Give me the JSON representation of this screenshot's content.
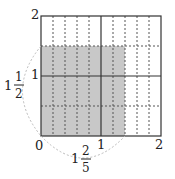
{
  "diagram": {
    "type": "area-model-multiplication",
    "grid": {
      "x_max": 2,
      "y_max": 2,
      "x_subdivisions_per_unit": 5,
      "y_subdivisions_per_unit": 2
    },
    "shaded_region": {
      "width": "1 2/5",
      "height": "1 1/2",
      "fill": "#c8c8c8"
    },
    "axis_labels": {
      "origin": "0",
      "x_one": "1",
      "x_two": "2",
      "y_one": "1",
      "y_two": "2"
    },
    "width_label": {
      "whole": "1",
      "numerator": "2",
      "denominator": "5"
    },
    "height_label": {
      "whole": "1",
      "numerator": "1",
      "denominator": "2"
    },
    "colors": {
      "line": "#333333",
      "dashed": "#555555",
      "shade": "#c8c8c8",
      "arc": "#bbbbbb"
    }
  }
}
